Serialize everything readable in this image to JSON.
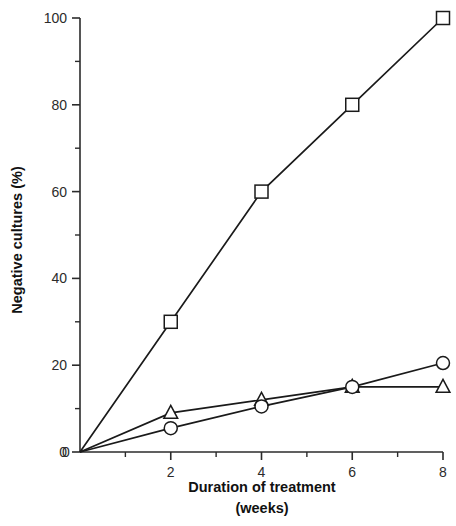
{
  "chart_data": {
    "type": "line",
    "title": "",
    "xlabel": "Duration of treatment (weeks)",
    "xlabel_line1": "Duration of treatment",
    "xlabel_line2": "(weeks)",
    "ylabel": "Negative cultures (%)",
    "xlim": [
      0,
      8
    ],
    "ylim": [
      0,
      100
    ],
    "grid": false,
    "legend": "none",
    "x": [
      0,
      2,
      4,
      6,
      8
    ],
    "xticks": [
      0,
      2,
      4,
      6,
      8
    ],
    "xtick_labels": [
      "0",
      "2",
      "4",
      "6",
      "8"
    ],
    "xticks_minor": [
      1,
      3,
      5,
      7
    ],
    "yticks": [
      0,
      20,
      40,
      60,
      80,
      100
    ],
    "ytick_labels": [
      "0",
      "20",
      "40",
      "60",
      "80",
      "100"
    ],
    "yticks_minor": [
      10,
      30,
      50,
      70,
      90
    ],
    "series": [
      {
        "name": "square-series",
        "marker": "square",
        "values": [
          0,
          30,
          60,
          80,
          100
        ]
      },
      {
        "name": "triangle-series",
        "marker": "triangle",
        "values": [
          0,
          9,
          12,
          15,
          15
        ]
      },
      {
        "name": "circle-series",
        "marker": "circle",
        "values": [
          0,
          5.5,
          10.5,
          15,
          20.5
        ]
      }
    ]
  },
  "colors": {
    "line": "#1a1a1a",
    "marker_fill": "#ffffff",
    "axis": "#2b2b2b",
    "background": "#ffffff"
  }
}
